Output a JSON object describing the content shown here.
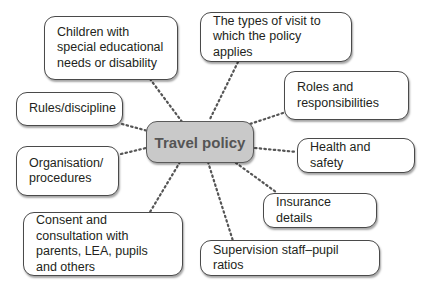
{
  "diagram": {
    "type": "mind-map",
    "center": {
      "label": "Travel policy",
      "fill": "#c9c9c9"
    },
    "nodes": [
      {
        "id": "sen",
        "label": "Children with special educational needs or disability"
      },
      {
        "id": "visit-types",
        "label": "The types of visit to which the policy applies"
      },
      {
        "id": "rules",
        "label": "Rules/discipline"
      },
      {
        "id": "roles",
        "label": "Roles and responsibilities"
      },
      {
        "id": "organisation",
        "label": "Organisation/ procedures"
      },
      {
        "id": "health",
        "label": "Health and safety"
      },
      {
        "id": "insurance",
        "label": "Insurance details"
      },
      {
        "id": "consent",
        "label": "Consent and consultation with parents, LEA, pupils and others"
      },
      {
        "id": "supervision",
        "label": "Supervision staff–pupil ratios"
      }
    ],
    "connector_style": "dotted"
  }
}
